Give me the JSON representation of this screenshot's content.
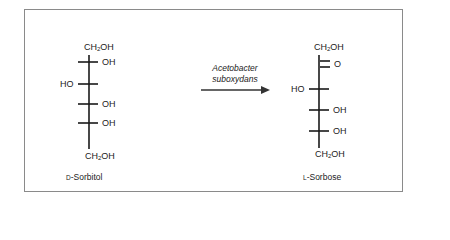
{
  "diagram": {
    "type": "chemical-reaction-fischer-projection",
    "reactant": {
      "name_prefix": "D",
      "name": "-Sorbitol",
      "top_group": "CH2OH",
      "substituents": [
        {
          "carbon": 2,
          "left": "",
          "right": "OH"
        },
        {
          "carbon": 3,
          "left": "HO",
          "right": ""
        },
        {
          "carbon": 4,
          "left": "",
          "right": "OH"
        },
        {
          "carbon": 5,
          "left": "",
          "right": "OH"
        }
      ],
      "bottom_group": "CH2OH"
    },
    "arrow": {
      "catalyst_line1": "Acetobacter",
      "catalyst_line2": "suboxydans",
      "direction": "right"
    },
    "product": {
      "name_prefix": "L",
      "name": "-Sorbose",
      "top_group": "CH2OH",
      "substituents": [
        {
          "carbon": 2,
          "left": "",
          "right": "O",
          "double_bond": true
        },
        {
          "carbon": 3,
          "left": "HO",
          "right": ""
        },
        {
          "carbon": 4,
          "left": "",
          "right": "OH"
        },
        {
          "carbon": 5,
          "left": "",
          "right": "OH"
        }
      ],
      "bottom_group": "CH2OH"
    },
    "labels": {
      "ch2": "CH",
      "sub2": "2",
      "oh_tail": "OH",
      "oh": "OH",
      "ho": "HO",
      "o": "O"
    },
    "colors": {
      "line": "#1a1a1a",
      "frame": "#8a8a8a",
      "arrow": "#333333"
    }
  }
}
